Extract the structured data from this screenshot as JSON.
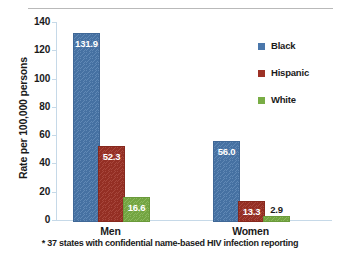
{
  "chart_data": {
    "type": "bar",
    "title": "",
    "xlabel": "",
    "ylabel": "Rate per 100,000 persons",
    "categories": [
      "Men",
      "Women"
    ],
    "series": [
      {
        "name": "Black",
        "color": "#4a77ab",
        "values": [
          131.9,
          56.0
        ],
        "labels": [
          "131.9",
          "56.0"
        ]
      },
      {
        "name": "Hispanic",
        "color": "#9d3226",
        "values": [
          52.3,
          13.3
        ],
        "labels": [
          "52.3",
          "13.3"
        ]
      },
      {
        "name": "White",
        "color": "#79ad45",
        "values": [
          16.6,
          2.9
        ],
        "labels": [
          "16.6",
          "2.9"
        ]
      }
    ],
    "ylim": [
      0,
      140
    ],
    "yticks": [
      0,
      20,
      40,
      60,
      80,
      100,
      120,
      140
    ],
    "ytick_labels": [
      "0",
      "20",
      "40",
      "60",
      "80",
      "100",
      "120",
      "140"
    ],
    "grid": false,
    "legend_position": "right"
  },
  "footnote": "* 37 states with confidential name-based HIV infection reporting",
  "legend": {
    "items": [
      {
        "label": "Black"
      },
      {
        "label": "Hispanic"
      },
      {
        "label": "White"
      }
    ]
  }
}
